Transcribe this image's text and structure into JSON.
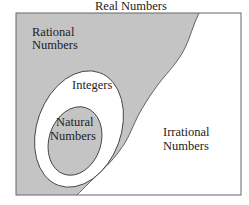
{
  "diagram": {
    "title": "Real Numbers",
    "regions": {
      "rational": {
        "line1": "Rational",
        "line2": "Numbers"
      },
      "integers": {
        "label": "Integers"
      },
      "natural": {
        "line1": "Natural",
        "line2": "Numbers"
      },
      "irrational": {
        "line1": "Irrational",
        "line2": "Numbers"
      }
    },
    "colors": {
      "shaded": "#c4c4c4",
      "background": "#ffffff",
      "outline": "#555555"
    }
  }
}
